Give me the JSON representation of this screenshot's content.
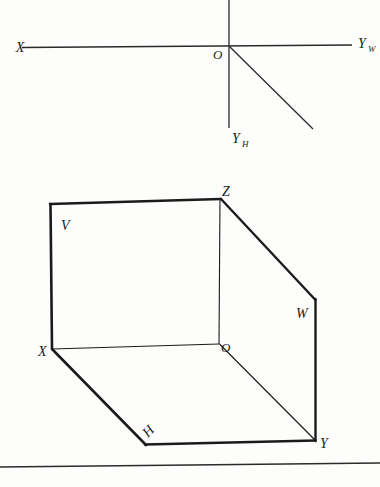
{
  "figure": {
    "background_color": "#fdfdfc",
    "ink_color": "#1b1b1b"
  },
  "top_diagram": {
    "name": "unfolded-axis-system",
    "labels": {
      "x_axis": "X",
      "y_w_axis": "Y",
      "y_w_subscript": "W",
      "y_h_axis": "Y",
      "y_h_subscript": "H",
      "origin": "O"
    },
    "axes": [
      {
        "id": "x-axis",
        "from": [
          22,
          47
        ],
        "to": [
          228,
          46
        ]
      },
      {
        "id": "yw-axis",
        "from": [
          228,
          46
        ],
        "to": [
          352,
          45
        ]
      },
      {
        "id": "z-axis-up",
        "from": [
          229,
          0
        ],
        "to": [
          229,
          46
        ]
      },
      {
        "id": "yh-axis-down",
        "from": [
          229,
          46
        ],
        "to": [
          229,
          128
        ]
      },
      {
        "id": "y-bisector",
        "from": [
          229,
          46
        ],
        "to": [
          313,
          129
        ]
      }
    ]
  },
  "bottom_diagram": {
    "name": "projection-planes-3d",
    "labels": {
      "plane_v": "V",
      "plane_h": "H",
      "plane_w": "W",
      "axis_x": "X",
      "axis_y": "Y",
      "axis_z": "Z",
      "origin": "O"
    },
    "vertices": {
      "Z": [
        221,
        199
      ],
      "V_top_left": [
        50,
        204
      ],
      "X": [
        52,
        349
      ],
      "O": [
        219,
        344
      ],
      "Y": [
        315,
        440
      ],
      "H_corner": [
        146,
        444
      ],
      "W_corner": [
        315,
        300
      ]
    }
  },
  "baseline_rule": {
    "name": "bottom-border-line",
    "from": [
      0,
      467
    ],
    "to": [
      380,
      463
    ]
  }
}
